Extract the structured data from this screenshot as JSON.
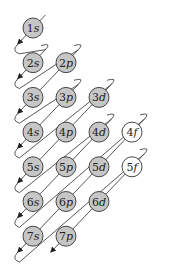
{
  "diagram": {
    "colors": {
      "filled": "#c6c6c6",
      "empty": "#ffffff",
      "stroke": "#333333",
      "line": "#444444"
    },
    "orbitals": [
      {
        "label_num": "1",
        "label_l": "s",
        "row": 0,
        "col": 0,
        "filled": true
      },
      {
        "label_num": "2",
        "label_l": "s",
        "row": 1,
        "col": 0,
        "filled": true
      },
      {
        "label_num": "2",
        "label_l": "p",
        "row": 1,
        "col": 1,
        "filled": true
      },
      {
        "label_num": "3",
        "label_l": "s",
        "row": 2,
        "col": 0,
        "filled": true
      },
      {
        "label_num": "3",
        "label_l": "p",
        "row": 2,
        "col": 1,
        "filled": true
      },
      {
        "label_num": "3",
        "label_l": "d",
        "row": 2,
        "col": 2,
        "filled": true
      },
      {
        "label_num": "4",
        "label_l": "s",
        "row": 3,
        "col": 0,
        "filled": true
      },
      {
        "label_num": "4",
        "label_l": "p",
        "row": 3,
        "col": 1,
        "filled": true
      },
      {
        "label_num": "4",
        "label_l": "d",
        "row": 3,
        "col": 2,
        "filled": true
      },
      {
        "label_num": "4",
        "label_l": "f",
        "row": 3,
        "col": 3,
        "filled": false
      },
      {
        "label_num": "5",
        "label_l": "s",
        "row": 4,
        "col": 0,
        "filled": true
      },
      {
        "label_num": "5",
        "label_l": "p",
        "row": 4,
        "col": 1,
        "filled": true
      },
      {
        "label_num": "5",
        "label_l": "d",
        "row": 4,
        "col": 2,
        "filled": true
      },
      {
        "label_num": "5",
        "label_l": "f",
        "row": 4,
        "col": 3,
        "filled": false
      },
      {
        "label_num": "6",
        "label_l": "s",
        "row": 5,
        "col": 0,
        "filled": true
      },
      {
        "label_num": "6",
        "label_l": "p",
        "row": 5,
        "col": 1,
        "filled": true
      },
      {
        "label_num": "6",
        "label_l": "d",
        "row": 5,
        "col": 2,
        "filled": true
      },
      {
        "label_num": "7",
        "label_l": "s",
        "row": 6,
        "col": 0,
        "filled": true
      },
      {
        "label_num": "7",
        "label_l": "p",
        "row": 6,
        "col": 1,
        "filled": true
      }
    ]
  }
}
